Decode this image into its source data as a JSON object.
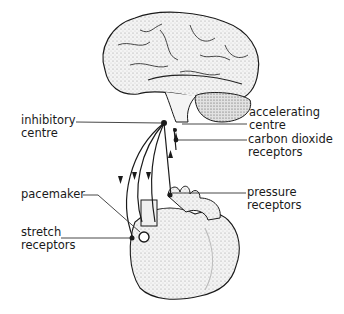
{
  "diagram": {
    "type": "anatomical illustration",
    "labels": {
      "inhibitory_centre": "inhibitory\ncentre",
      "accelerating_centre": "accelerating\ncentre",
      "carbon_dioxide_receptors": "carbon dioxide\nreceptors",
      "pacemaker": "pacemaker",
      "pressure_receptors": "pressure\nreceptors",
      "stretch_receptors": "stretch\nreceptors"
    },
    "colors": {
      "ink": "#1a1a1a",
      "fill_light": "#f2f2f2",
      "fill_mid": "#d9d9d9",
      "background": "#ffffff"
    }
  }
}
